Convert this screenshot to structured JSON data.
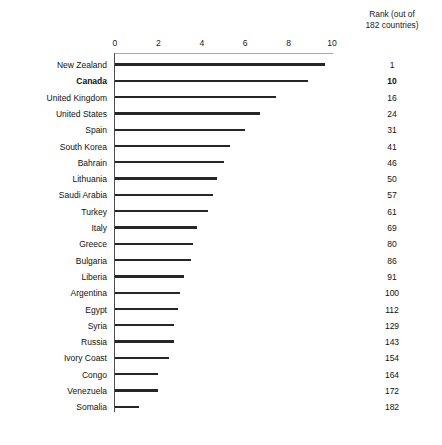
{
  "rank_header": "Rank (out of\n182 countries)",
  "axis": {
    "ticks": [
      {
        "label": "0",
        "value": 0
      },
      {
        "label": "2",
        "value": 2
      },
      {
        "label": "4",
        "value": 4
      },
      {
        "label": "6",
        "value": 6
      },
      {
        "label": "8",
        "value": 8
      },
      {
        "label": "10",
        "value": 10
      }
    ]
  },
  "chart_data": {
    "type": "bar",
    "orientation": "horizontal",
    "title": "",
    "subtitle": "",
    "xlabel": "",
    "ylabel": "",
    "xlim": [
      0,
      10
    ],
    "grid": false,
    "legend": null,
    "value_axis_ticks": [
      0,
      2,
      4,
      6,
      8,
      10
    ],
    "highlight_category": "Canada",
    "extra_column": {
      "header": "Rank (out of 182 countries)",
      "values": [
        1,
        10,
        16,
        24,
        31,
        41,
        46,
        50,
        57,
        61,
        69,
        80,
        86,
        91,
        100,
        112,
        129,
        143,
        154,
        164,
        172,
        182
      ]
    },
    "categories": [
      "New Zealand",
      "Canada",
      "United Kingdom",
      "United States",
      "Spain",
      "South Korea",
      "Bahrain",
      "Lithuania",
      "Saudi Arabia",
      "Turkey",
      "Italy",
      "Greece",
      "Bulgaria",
      "Liberia",
      "Argentina",
      "Egypt",
      "Syria",
      "Russia",
      "Ivory Coast",
      "Congo",
      "Venezuela",
      "Somalia"
    ],
    "values": [
      9.7,
      8.9,
      7.4,
      6.7,
      6.0,
      5.3,
      5.0,
      4.7,
      4.5,
      4.3,
      3.8,
      3.6,
      3.5,
      3.2,
      3.0,
      2.9,
      2.7,
      2.7,
      2.5,
      2.0,
      2.0,
      1.1
    ]
  },
  "rows": [
    {
      "country": "New Zealand",
      "value": 9.7,
      "rank": "1",
      "bold": false
    },
    {
      "country": "Canada",
      "value": 8.9,
      "rank": "10",
      "bold": true
    },
    {
      "country": "United Kingdom",
      "value": 7.4,
      "rank": "16",
      "bold": false
    },
    {
      "country": "United States",
      "value": 6.7,
      "rank": "24",
      "bold": false
    },
    {
      "country": "Spain",
      "value": 6.0,
      "rank": "31",
      "bold": false
    },
    {
      "country": "South Korea",
      "value": 5.3,
      "rank": "41",
      "bold": false
    },
    {
      "country": "Bahrain",
      "value": 5.0,
      "rank": "46",
      "bold": false
    },
    {
      "country": "Lithuania",
      "value": 4.7,
      "rank": "50",
      "bold": false
    },
    {
      "country": "Saudi Arabia",
      "value": 4.5,
      "rank": "57",
      "bold": false
    },
    {
      "country": "Turkey",
      "value": 4.3,
      "rank": "61",
      "bold": false
    },
    {
      "country": "Italy",
      "value": 3.8,
      "rank": "69",
      "bold": false
    },
    {
      "country": "Greece",
      "value": 3.6,
      "rank": "80",
      "bold": false
    },
    {
      "country": "Bulgaria",
      "value": 3.5,
      "rank": "86",
      "bold": false
    },
    {
      "country": "Liberia",
      "value": 3.2,
      "rank": "91",
      "bold": false
    },
    {
      "country": "Argentina",
      "value": 3.0,
      "rank": "100",
      "bold": false
    },
    {
      "country": "Egypt",
      "value": 2.9,
      "rank": "112",
      "bold": false
    },
    {
      "country": "Syria",
      "value": 2.7,
      "rank": "129",
      "bold": false
    },
    {
      "country": "Russia",
      "value": 2.7,
      "rank": "143",
      "bold": false
    },
    {
      "country": "Ivory Coast",
      "value": 2.5,
      "rank": "154",
      "bold": false
    },
    {
      "country": "Congo",
      "value": 2.0,
      "rank": "164",
      "bold": false
    },
    {
      "country": "Venezuela",
      "value": 2.0,
      "rank": "172",
      "bold": false
    },
    {
      "country": "Somalia",
      "value": 1.1,
      "rank": "182",
      "bold": false
    }
  ],
  "geometry": {
    "axis_origin_x": 115,
    "px_per_unit": 21.7,
    "first_row_top": 60,
    "row_step": 16.3
  }
}
